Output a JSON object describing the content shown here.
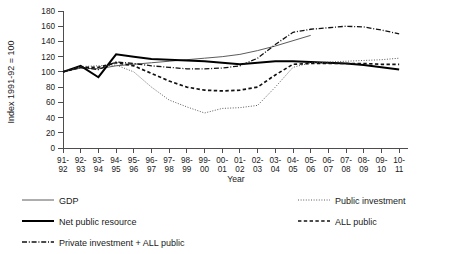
{
  "chart_data": {
    "type": "line",
    "title": "",
    "xlabel": "Year",
    "ylabel": "Index 1991-92 = 100",
    "ylim": [
      0,
      180
    ],
    "yticks": [
      0,
      20,
      40,
      60,
      80,
      100,
      120,
      140,
      160,
      180
    ],
    "grid": false,
    "legend_position": "bottom",
    "categories": [
      "91-\n92",
      "92-\n93",
      "93-\n94",
      "94-\n95",
      "95-\n96",
      "96-\n97",
      "97-\n98",
      "98-\n99",
      "99-\n00",
      "00-\n01",
      "01-\n02",
      "02-\n03",
      "03-\n04",
      "04-\n05",
      "05-\n06",
      "06-\n07",
      "07-\n08",
      "08-\n09",
      "09-\n10",
      "10-\n11"
    ],
    "categories_top": [
      "91-",
      "92-",
      "93-",
      "94-",
      "95-",
      "96-",
      "97-",
      "98-",
      "99-",
      "00-",
      "01-",
      "02-",
      "03-",
      "04-",
      "05-",
      "06-",
      "07-",
      "08-",
      "09-",
      "10-"
    ],
    "categories_bottom": [
      "92",
      "93",
      "94",
      "95",
      "96",
      "97",
      "98",
      "99",
      "00",
      "01",
      "02",
      "03",
      "04",
      "05",
      "06",
      "07",
      "08",
      "09",
      "10",
      "11"
    ],
    "series": [
      {
        "name": "GDP",
        "style": "solid-thin",
        "color": "#5c5c5c",
        "values": [
          100,
          105,
          104,
          108,
          110,
          112,
          114,
          116,
          118,
          120,
          123,
          128,
          134,
          141,
          148,
          null,
          null,
          null,
          null,
          null
        ]
      },
      {
        "name": "Net public resource",
        "style": "solid-thick",
        "color": "#000000",
        "values": [
          100,
          108,
          93,
          123,
          120,
          117,
          116,
          115,
          114,
          112,
          110,
          112,
          114,
          114,
          113,
          112,
          111,
          109,
          106,
          103
        ]
      },
      {
        "name": "Public investment",
        "style": "dotted",
        "color": "#5c5c5c",
        "values": [
          100,
          107,
          108,
          109,
          100,
          80,
          63,
          54,
          46,
          52,
          53,
          56,
          80,
          106,
          112,
          113,
          114,
          115,
          116,
          118
        ]
      },
      {
        "name": "ALL public",
        "style": "dashed",
        "color": "#111111",
        "values": [
          100,
          106,
          106,
          112,
          108,
          98,
          88,
          80,
          76,
          75,
          76,
          80,
          96,
          110,
          111,
          111,
          111,
          111,
          110,
          110
        ]
      },
      {
        "name": "Private investment + ALL public",
        "style": "dash-dot",
        "color": "#111111",
        "values": [
          100,
          106,
          103,
          113,
          111,
          108,
          106,
          104,
          104,
          105,
          108,
          118,
          136,
          152,
          156,
          158,
          160,
          159,
          155,
          150
        ]
      }
    ]
  },
  "legend": {
    "items": [
      {
        "label": "GDP",
        "style": "solid-thin"
      },
      {
        "label": "Public investment",
        "style": "dotted"
      },
      {
        "label": "Net public resource",
        "style": "solid-thick"
      },
      {
        "label": "ALL public",
        "style": "dashed"
      },
      {
        "label": "Private investment + ALL public",
        "style": "dash-dot"
      }
    ]
  }
}
